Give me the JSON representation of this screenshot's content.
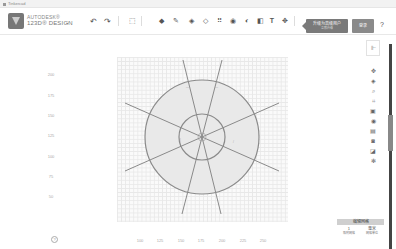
{
  "browser": {
    "tab_title": "Tinkercad"
  },
  "header": {
    "brand_line1": "AUTODESK®",
    "brand_line2": "123D® DESIGN",
    "undo_icon": "undo-arrow",
    "redo_icon": "redo-arrow",
    "tools": [
      {
        "name": "transform-icon",
        "glyph": "⬚"
      },
      {
        "name": "primitives-icon",
        "glyph": "◆"
      },
      {
        "name": "sketch-icon",
        "glyph": "✎"
      },
      {
        "name": "construct-icon",
        "glyph": "◈"
      },
      {
        "name": "modify-icon",
        "glyph": "◇"
      },
      {
        "name": "pattern-icon",
        "glyph": "⠿"
      },
      {
        "name": "group-icon",
        "glyph": "◉"
      },
      {
        "name": "combine-icon",
        "glyph": "◐"
      },
      {
        "name": "measure-icon",
        "glyph": "◧"
      },
      {
        "name": "text-icon",
        "glyph": "T"
      },
      {
        "name": "snap-icon",
        "glyph": "✥"
      },
      {
        "name": "material-icon",
        "glyph": "▮"
      }
    ],
    "upgrade_label": "升级为高级用户",
    "upgrade_sub": "立即升级",
    "login_label": "登录",
    "help_label": "?"
  },
  "workplane": {
    "y_labels": [
      {
        "text": "200",
        "y": 74
      },
      {
        "text": "175",
        "y": 95
      },
      {
        "text": "150",
        "y": 115
      },
      {
        "text": "125",
        "y": 135
      },
      {
        "text": "100",
        "y": 156
      },
      {
        "text": "75",
        "y": 176
      },
      {
        "text": "50",
        "y": 196
      }
    ],
    "x_labels": [
      {
        "text": "100",
        "x": 140
      },
      {
        "text": "125",
        "x": 160
      },
      {
        "text": "150",
        "x": 181
      },
      {
        "text": "175",
        "x": 201
      },
      {
        "text": "200",
        "x": 222
      },
      {
        "text": "225",
        "x": 243
      },
      {
        "text": "250",
        "x": 263
      }
    ]
  },
  "right_panel": {
    "toggle_icon": "panel-toggle",
    "view_tools": [
      {
        "name": "pan-icon",
        "glyph": "✥"
      },
      {
        "name": "orbit-icon",
        "glyph": "◈"
      },
      {
        "name": "zoom-icon",
        "glyph": "⌕"
      },
      {
        "name": "fit-icon",
        "glyph": "⌗"
      },
      {
        "name": "view-box-icon",
        "glyph": "▣"
      },
      {
        "name": "visibility-icon",
        "glyph": "◉"
      },
      {
        "name": "material-view-icon",
        "glyph": "▤"
      },
      {
        "name": "camera-icon",
        "glyph": "◙"
      },
      {
        "name": "export-icon",
        "glyph": "◪"
      },
      {
        "name": "settings-icon",
        "glyph": "✻"
      }
    ]
  },
  "grid_panel": {
    "title": "编辑网格",
    "snap_value": "1",
    "snap_label": "吸附网格",
    "unit_value": "毫米",
    "unit_label": "网格单位"
  },
  "bottom_left": {
    "icon": "?"
  }
}
